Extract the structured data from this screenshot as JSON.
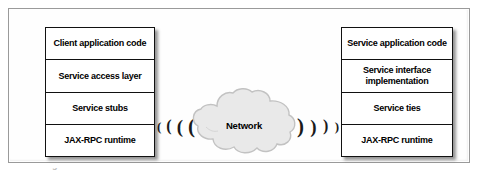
{
  "figure": {
    "client_stack": {
      "name": "client-stack",
      "layers": [
        {
          "label": "Client application code"
        },
        {
          "label": "Service access layer"
        },
        {
          "label": "Service stubs"
        },
        {
          "label": "JAX-RPC runtime"
        }
      ]
    },
    "service_stack": {
      "name": "service-stack",
      "layers": [
        {
          "label": "Service application code"
        },
        {
          "label": "Service interface\nimplementation"
        },
        {
          "label": "Service ties"
        },
        {
          "label": "JAX-RPC runtime"
        }
      ]
    },
    "network": {
      "label": "Network",
      "cloud_fill": "#e8e8e8",
      "cloud_stroke": "#bdbdbd"
    },
    "signals": {
      "left": [
        "(",
        "(",
        "(",
        "("
      ],
      "right": [
        ")",
        ")",
        ")",
        ")"
      ]
    },
    "caption_fragment": "Figure                       JAX-RPC",
    "colors": {
      "box_border": "#111111",
      "frame_border": "#9a9a9a",
      "text": "#000000",
      "page_background": "#ffffff"
    }
  }
}
